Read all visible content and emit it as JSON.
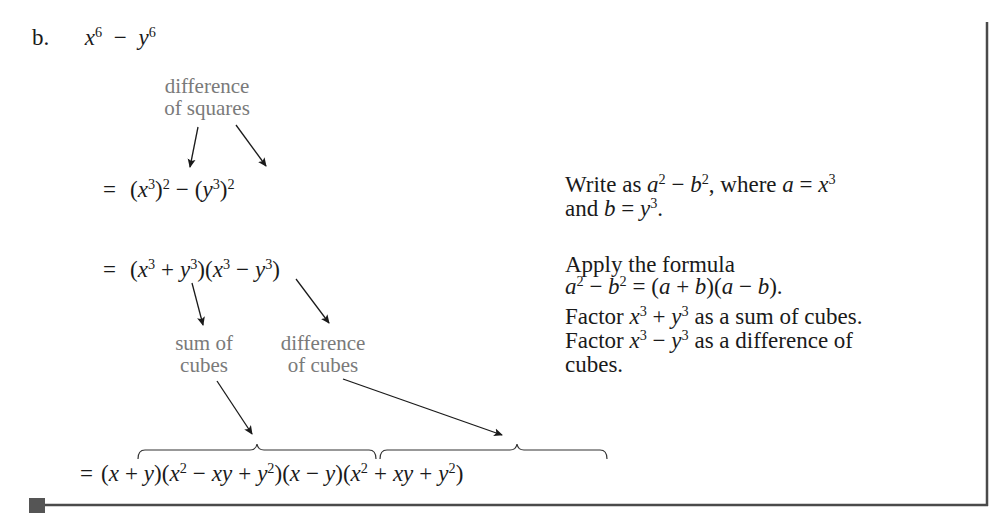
{
  "problem": {
    "label": "b.",
    "expression": {
      "base1": "x",
      "exp1": "6",
      "op": "−",
      "base2": "y",
      "exp2": "6"
    }
  },
  "annotations": {
    "difference_of_squares": [
      "difference",
      "of squares"
    ],
    "sum_of_cubes": [
      "sum of",
      "cubes"
    ],
    "difference_of_cubes": [
      "difference",
      "of cubes"
    ]
  },
  "steps": [
    {
      "math": "= (x³)² − (y³)²",
      "explanation_lines": [
        "Write as a² − b², where a = x³",
        "and b = y³."
      ]
    },
    {
      "math": "= (x³ + y³)(x³ − y³)",
      "explanation_lines": [
        "Apply the formula",
        "a² − b² = (a + b)(a − b)."
      ]
    },
    {
      "math": "",
      "explanation_lines": [
        "Factor x³ + y³ as a sum of cubes.",
        "Factor x³ − y³ as a difference of",
        "cubes."
      ]
    },
    {
      "math": "= (x + y)(x² − xy + y²)(x − y)(x² + xy + y²)",
      "explanation_lines": []
    }
  ],
  "colors": {
    "text": "#1a1a1a",
    "annotation": "#7a7a7a",
    "rule": "#4a4a4a"
  }
}
